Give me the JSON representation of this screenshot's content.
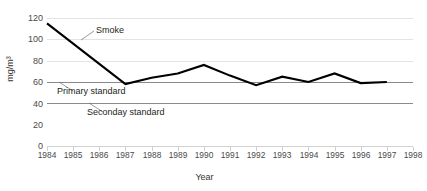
{
  "chart_data": {
    "type": "line",
    "title": "",
    "xlabel": "Year",
    "ylabel": "mg/m³",
    "x": [
      1984,
      1985,
      1986,
      1987,
      1988,
      1989,
      1990,
      1991,
      1992,
      1993,
      1994,
      1995,
      1996,
      1997
    ],
    "xlim": [
      1984,
      1998
    ],
    "ylim": [
      0,
      120
    ],
    "yticks": [
      0,
      20,
      40,
      60,
      80,
      100,
      120
    ],
    "xticks": [
      1984,
      1985,
      1986,
      1987,
      1988,
      1989,
      1990,
      1991,
      1992,
      1993,
      1994,
      1995,
      1996,
      1997,
      1998
    ],
    "grid": true,
    "legend_position": "inline-annotations",
    "series": [
      {
        "name": "Smoke",
        "color": "#000000",
        "values": [
          115,
          96,
          77,
          58,
          64,
          68,
          76,
          66,
          57,
          65,
          60,
          68,
          59,
          60
        ]
      }
    ],
    "reference_lines": [
      {
        "label": "Primary standard",
        "value": 60,
        "color": "#8a8a8a"
      },
      {
        "label": "Seconday standard",
        "value": 40,
        "color": "#8a8a8a"
      }
    ],
    "annotations": [
      {
        "label": "Smoke",
        "target_x": 1985,
        "target_y": 101
      },
      {
        "label": "Primary standard",
        "target_x": 1986,
        "target_y": 60
      },
      {
        "label": "Seconday standard",
        "target_x": 1987,
        "target_y": 40
      }
    ]
  },
  "axes": {
    "y_title": "mg/m³",
    "x_title": "Year",
    "y_tick_labels": [
      "120",
      "100",
      "80",
      "60",
      "40",
      "20",
      "0"
    ],
    "x_tick_labels": [
      "1984",
      "1985",
      "1986",
      "1987",
      "1988",
      "1989",
      "1990",
      "1991",
      "1992",
      "1993",
      "1994",
      "1995",
      "1996",
      "1997",
      "1998"
    ]
  },
  "annotations": {
    "smoke": "Smoke",
    "primary_standard": "Primary standard",
    "seconday_standard": "Seconday standard"
  }
}
